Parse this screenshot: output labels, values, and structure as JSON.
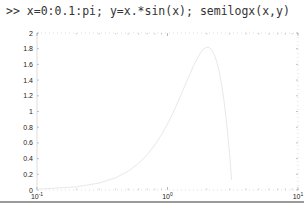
{
  "command": {
    "prompt": ">>",
    "text": "x=0:0.1:pi; y=x.*sin(x); semilogx(x,y)"
  },
  "chart_data": {
    "type": "line",
    "title": "",
    "xlabel": "",
    "ylabel": "",
    "xscale": "log",
    "xlim": [
      0.1,
      10
    ],
    "ylim": [
      0,
      2
    ],
    "grid": false,
    "legend": null,
    "x_ticks": [
      {
        "value": 0.1,
        "base": "10",
        "exp": "-1"
      },
      {
        "value": 1,
        "base": "10",
        "exp": "0"
      },
      {
        "value": 10,
        "base": "10",
        "exp": "1"
      }
    ],
    "y_ticks": [
      "0",
      "0.2",
      "0.4",
      "0.6",
      "0.8",
      "1",
      "1.2",
      "1.4",
      "1.6",
      "1.8",
      "2"
    ],
    "series": [
      {
        "name": "y = x.*sin(x)",
        "color": "#e8e8e8",
        "x": [
          0.1,
          0.2,
          0.3,
          0.4,
          0.5,
          0.6,
          0.7,
          0.8,
          0.9,
          1.0,
          1.1,
          1.2,
          1.3,
          1.4,
          1.5,
          1.6,
          1.7,
          1.8,
          1.9,
          2.0,
          2.1,
          2.2,
          2.3,
          2.4,
          2.5,
          2.6,
          2.7,
          2.8,
          2.9,
          3.0,
          3.1
        ],
        "y": [
          0.01,
          0.04,
          0.089,
          0.156,
          0.24,
          0.339,
          0.451,
          0.574,
          0.705,
          0.841,
          0.98,
          1.118,
          1.253,
          1.38,
          1.496,
          1.599,
          1.683,
          1.753,
          1.799,
          1.819,
          1.812,
          1.775,
          1.709,
          1.621,
          1.496,
          1.338,
          1.154,
          0.939,
          0.697,
          0.423,
          0.129
        ]
      }
    ]
  },
  "colors": {
    "axis": "#c8c8c8",
    "text": "#222222",
    "line": "#e8e8e8"
  }
}
